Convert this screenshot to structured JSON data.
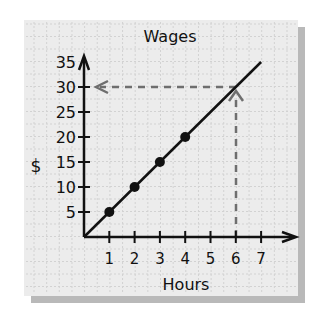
{
  "chart_data": {
    "type": "line",
    "title": "Wages",
    "xlabel": "Hours",
    "ylabel": "$",
    "x_ticks": [
      "1",
      "2",
      "3",
      "4",
      "5",
      "6",
      "7"
    ],
    "y_ticks": [
      "5",
      "10",
      "15",
      "20",
      "25",
      "30",
      "35"
    ],
    "xlim": [
      0,
      8
    ],
    "ylim": [
      0,
      35
    ],
    "grid": true,
    "series": [
      {
        "name": "Wages",
        "x": [
          0,
          1,
          2,
          3,
          4,
          5,
          6,
          7
        ],
        "y": [
          0,
          5,
          10,
          15,
          20,
          25,
          30,
          35
        ],
        "marked_points": [
          [
            1,
            5
          ],
          [
            2,
            10
          ],
          [
            3,
            15
          ],
          [
            4,
            20
          ]
        ]
      }
    ],
    "annotations": [
      {
        "type": "dashed-arrow",
        "from": [
          6,
          0
        ],
        "to": [
          6,
          30
        ],
        "label": "read up from 6 hours"
      },
      {
        "type": "dashed-arrow",
        "from": [
          6,
          30
        ],
        "to": [
          0,
          30
        ],
        "label": "read across to $30"
      }
    ]
  },
  "colors": {
    "panel": "#ececec",
    "shadow": "#b9b9b9",
    "grid": "#d2d2d2",
    "axis": "#111111",
    "dashed": "#6e6e6e"
  }
}
